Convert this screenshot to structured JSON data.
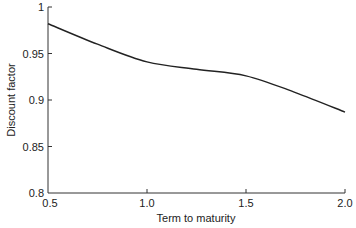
{
  "chart_data": {
    "type": "line",
    "title": "",
    "xlabel": "Term to maturity",
    "ylabel": "Discount factor",
    "xlim": [
      0.5,
      2.0
    ],
    "ylim": [
      0.8,
      1.0
    ],
    "x_ticks": [
      "0.5",
      "1.0",
      "1.5",
      "2.0"
    ],
    "y_ticks": [
      "0.8",
      "0.85",
      "0.9",
      "0.95",
      "1"
    ],
    "grid": false,
    "legend": null,
    "series": [
      {
        "name": "Discount factor",
        "x": [
          0.5,
          0.75,
          1.0,
          1.25,
          1.5,
          1.75,
          2.0
        ],
        "values": [
          0.982,
          0.96,
          0.941,
          0.933,
          0.926,
          0.908,
          0.887
        ]
      }
    ]
  }
}
